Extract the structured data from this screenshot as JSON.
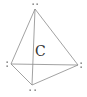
{
  "diagram": {
    "center_atom": "C",
    "vertices": [
      {
        "id": "top",
        "label": ":",
        "lone_pair_dots": 2
      },
      {
        "id": "left",
        "label": ":",
        "lone_pair_dots": 2
      },
      {
        "id": "right",
        "label": ":",
        "lone_pair_dots": 2
      },
      {
        "id": "bottom",
        "label": ":",
        "lone_pair_dots": 2
      }
    ],
    "edges": [
      [
        "top",
        "left"
      ],
      [
        "top",
        "right"
      ],
      [
        "top",
        "bottom"
      ],
      [
        "left",
        "right"
      ],
      [
        "left",
        "bottom"
      ],
      [
        "right",
        "bottom"
      ]
    ],
    "colors": {
      "edge": "#8a8a8a",
      "dots": "#555555",
      "label": "#333333",
      "background": "#ffffff"
    }
  }
}
